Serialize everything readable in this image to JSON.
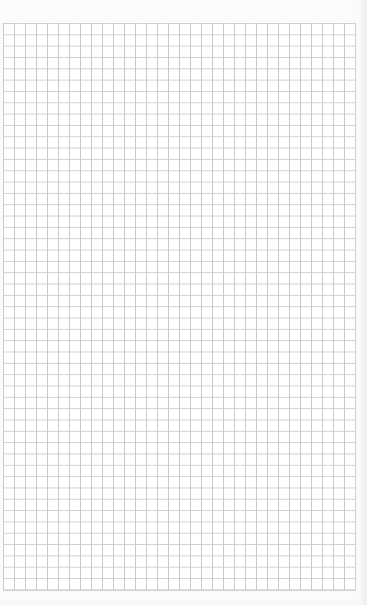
{
  "page": {
    "type": "graph-paper",
    "grid": {
      "columns": 32,
      "rows": 50,
      "line_color": "#c9c9c9",
      "background": "#ffffff"
    }
  }
}
